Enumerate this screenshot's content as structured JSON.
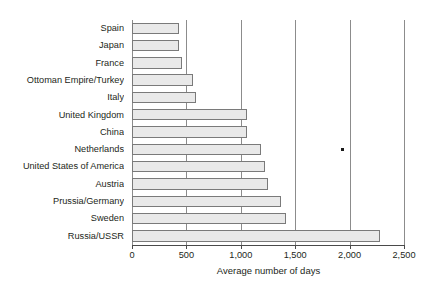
{
  "chart_data": {
    "type": "bar",
    "orientation": "horizontal",
    "title": "",
    "subtitle": "",
    "xlabel": "Average number of days",
    "ylabel": "",
    "xlim": [
      0,
      2500
    ],
    "grid": true,
    "legend": null,
    "xticks": [
      0,
      500,
      1000,
      1500,
      2000,
      2500
    ],
    "xtick_labels": [
      "0",
      "500",
      "1,000",
      "1,500",
      "2,000",
      "2,500"
    ],
    "categories": [
      "Spain",
      "Japan",
      "France",
      "Ottoman Empire/Turkey",
      "Italy",
      "United Kingdom",
      "China",
      "Netherlands",
      "United States of America",
      "Austria",
      "Prussia/Germany",
      "Sweden",
      "Russia/USSR"
    ],
    "values": [
      430,
      430,
      460,
      560,
      590,
      1060,
      1060,
      1190,
      1220,
      1250,
      1370,
      1420,
      2280
    ],
    "annotations": [
      {
        "name": "stray-point-marker",
        "x": 1930,
        "y_row": 7
      }
    ],
    "colors": {
      "bar_fill": "#e9e9e9",
      "bar_stroke": "#7a7a7a",
      "gridline": "#8c8c8c",
      "axis": "#4a4a4a",
      "text": "#231f20",
      "background": "#ffffff"
    }
  }
}
